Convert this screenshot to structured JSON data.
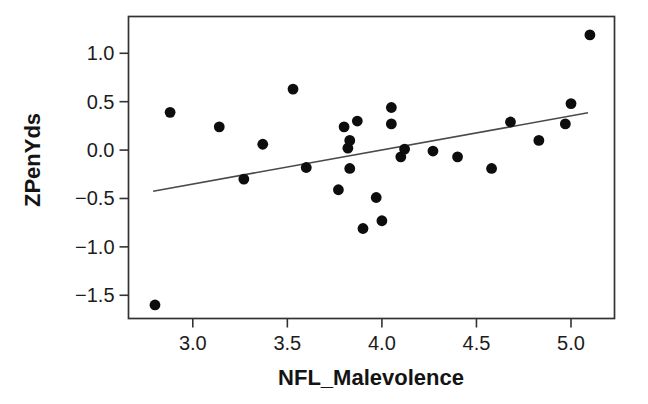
{
  "window": {
    "width_px": 648,
    "height_px": 404,
    "background": "#ffffff"
  },
  "colors": {
    "point": "#0d0d0d",
    "regression_line": "#4a4a4a",
    "frame": "#333333",
    "tick": "#333333",
    "text": "#1c1c1c"
  },
  "chart_data": {
    "type": "scatter",
    "title": "",
    "xlabel": "NFL_Malevolence",
    "ylabel": "ZPenYds",
    "xlim": [
      2.66,
      5.23
    ],
    "ylim": [
      -1.74,
      1.38
    ],
    "x_ticks": [
      3.0,
      3.5,
      4.0,
      4.5,
      5.0
    ],
    "y_ticks": [
      1.0,
      0.5,
      0.0,
      -0.5,
      -1.0,
      -1.5
    ],
    "grid": false,
    "legend": false,
    "marker": {
      "shape": "filled-circle",
      "radius_px": 5.4
    },
    "n_points": 28,
    "points": [
      [
        2.8,
        -1.6
      ],
      [
        2.88,
        0.39
      ],
      [
        3.14,
        0.24
      ],
      [
        3.27,
        -0.3
      ],
      [
        3.37,
        0.06
      ],
      [
        3.53,
        0.63
      ],
      [
        3.6,
        -0.18
      ],
      [
        3.77,
        -0.41
      ],
      [
        3.8,
        0.24
      ],
      [
        3.82,
        0.02
      ],
      [
        3.83,
        0.1
      ],
      [
        3.83,
        -0.19
      ],
      [
        3.87,
        0.3
      ],
      [
        3.9,
        -0.81
      ],
      [
        3.97,
        -0.49
      ],
      [
        4.0,
        -0.73
      ],
      [
        4.05,
        0.44
      ],
      [
        4.05,
        0.27
      ],
      [
        4.1,
        -0.07
      ],
      [
        4.12,
        0.01
      ],
      [
        4.27,
        -0.01
      ],
      [
        4.4,
        -0.07
      ],
      [
        4.58,
        -0.19
      ],
      [
        4.68,
        0.29
      ],
      [
        4.83,
        0.1
      ],
      [
        4.97,
        0.27
      ],
      [
        5.0,
        0.48
      ],
      [
        5.1,
        1.19
      ]
    ],
    "regression_line": {
      "x1": 2.79,
      "y1": -0.425,
      "x2": 5.09,
      "y2": 0.385
    }
  }
}
